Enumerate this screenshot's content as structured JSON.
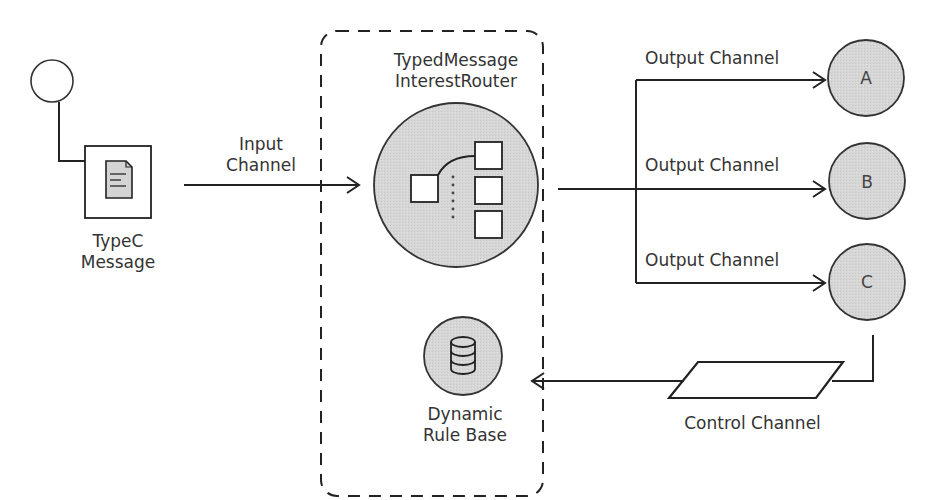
{
  "diagram": {
    "colors": {
      "stroke": "#222222",
      "node_fill": "#d8d8d8",
      "text": "#333333",
      "background": "#ffffff"
    },
    "source": {
      "label_line1": "TypeC",
      "label_line2": "Message",
      "icon": "document-icon"
    },
    "input_channel": {
      "label_line1": "Input",
      "label_line2": "Channel"
    },
    "router": {
      "label_line1": "TypedMessage",
      "label_line2": "InterestRouter",
      "icon": "routing-tree-icon"
    },
    "rule_base": {
      "label_line1": "Dynamic",
      "label_line2": "Rule Base",
      "icon": "database-icon"
    },
    "outputs": [
      {
        "channel_label": "Output Channel",
        "node": "A"
      },
      {
        "channel_label": "Output Channel",
        "node": "B"
      },
      {
        "channel_label": "Output Channel",
        "node": "C"
      }
    ],
    "control_channel": {
      "label": "Control Channel"
    }
  }
}
